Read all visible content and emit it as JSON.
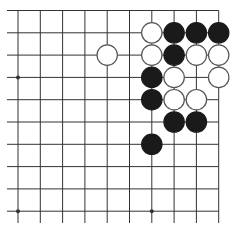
{
  "board": {
    "description": "Go problem diagram, upper-right corner",
    "columns": 10,
    "rows": 10,
    "edges": {
      "top": true,
      "right": true,
      "left": false,
      "bottom": false
    },
    "colors": {
      "line": "#333333",
      "black_stone": "#1a1a1a",
      "white_stone": "#ffffff",
      "white_outline": "#555555",
      "background": "#ffffff"
    },
    "star_points": [
      {
        "col": 0,
        "row": 3
      },
      {
        "col": 0,
        "row": 9
      },
      {
        "col": 6,
        "row": 9
      }
    ],
    "stones": [
      {
        "color": "white",
        "col": 6,
        "row": 1
      },
      {
        "color": "black",
        "col": 7,
        "row": 1
      },
      {
        "color": "black",
        "col": 8,
        "row": 1
      },
      {
        "color": "black",
        "col": 9,
        "row": 1
      },
      {
        "color": "white",
        "col": 4,
        "row": 2
      },
      {
        "color": "white",
        "col": 6,
        "row": 2
      },
      {
        "color": "black",
        "col": 7,
        "row": 2
      },
      {
        "color": "white",
        "col": 8,
        "row": 2
      },
      {
        "color": "white",
        "col": 9,
        "row": 2
      },
      {
        "color": "black",
        "col": 6,
        "row": 3
      },
      {
        "color": "white",
        "col": 7,
        "row": 3
      },
      {
        "color": "white",
        "col": 9,
        "row": 3
      },
      {
        "color": "black",
        "col": 6,
        "row": 4
      },
      {
        "color": "white",
        "col": 7,
        "row": 4
      },
      {
        "color": "white",
        "col": 8,
        "row": 4
      },
      {
        "color": "black",
        "col": 7,
        "row": 5
      },
      {
        "color": "black",
        "col": 8,
        "row": 5
      },
      {
        "color": "black",
        "col": 6,
        "row": 6
      }
    ]
  }
}
